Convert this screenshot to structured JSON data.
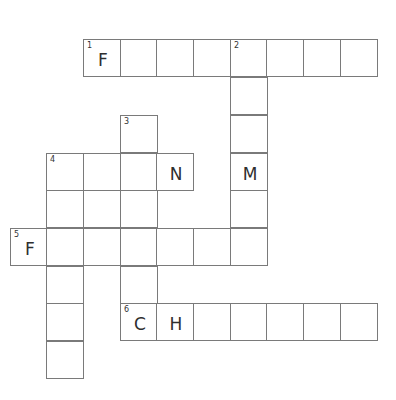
{
  "puzzle": {
    "type": "crossword",
    "cell_size": 37,
    "cells": [
      {
        "r": 0,
        "c": 2,
        "num": "1",
        "letter": "F"
      },
      {
        "r": 0,
        "c": 3
      },
      {
        "r": 0,
        "c": 4
      },
      {
        "r": 0,
        "c": 5
      },
      {
        "r": 0,
        "c": 6,
        "num": "2"
      },
      {
        "r": 0,
        "c": 7
      },
      {
        "r": 0,
        "c": 8
      },
      {
        "r": 0,
        "c": 9
      },
      {
        "r": 1,
        "c": 6
      },
      {
        "r": 2,
        "c": 3,
        "num": "3"
      },
      {
        "r": 2,
        "c": 6
      },
      {
        "r": 3,
        "c": 1,
        "num": "4"
      },
      {
        "r": 3,
        "c": 2
      },
      {
        "r": 3,
        "c": 3
      },
      {
        "r": 3,
        "c": 4,
        "letter": "N"
      },
      {
        "r": 3,
        "c": 6,
        "letter": "M"
      },
      {
        "r": 4,
        "c": 1
      },
      {
        "r": 4,
        "c": 2
      },
      {
        "r": 4,
        "c": 3
      },
      {
        "r": 4,
        "c": 6
      },
      {
        "r": 5,
        "c": 0,
        "num": "5",
        "letter": "F"
      },
      {
        "r": 5,
        "c": 1
      },
      {
        "r": 5,
        "c": 2
      },
      {
        "r": 5,
        "c": 3
      },
      {
        "r": 5,
        "c": 4
      },
      {
        "r": 5,
        "c": 5
      },
      {
        "r": 5,
        "c": 6
      },
      {
        "r": 6,
        "c": 1
      },
      {
        "r": 6,
        "c": 3
      },
      {
        "r": 7,
        "c": 1
      },
      {
        "r": 7,
        "c": 3,
        "num": "6",
        "letter": "C"
      },
      {
        "r": 7,
        "c": 4,
        "letter": "H"
      },
      {
        "r": 7,
        "c": 5
      },
      {
        "r": 7,
        "c": 6
      },
      {
        "r": 7,
        "c": 7
      },
      {
        "r": 7,
        "c": 8
      },
      {
        "r": 7,
        "c": 9
      },
      {
        "r": 8,
        "c": 1
      }
    ],
    "col_x": [
      10,
      46,
      83,
      120,
      156,
      193,
      230,
      266,
      303,
      340
    ],
    "row_y": [
      39,
      77,
      115,
      153,
      190,
      228,
      266,
      303,
      341
    ]
  }
}
